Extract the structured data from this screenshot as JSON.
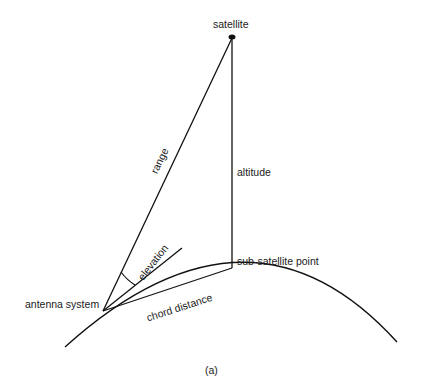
{
  "diagram": {
    "labels": {
      "satellite": "satellite",
      "range": "range",
      "altitude": "altitude",
      "elevation": "elevation",
      "sub_satellite_point": "sub-satellite point",
      "antenna_system": "antenna system",
      "chord_distance": "chord distance",
      "caption": "(a)"
    },
    "colors": {
      "line": "#111111",
      "background": "#ffffff"
    }
  }
}
